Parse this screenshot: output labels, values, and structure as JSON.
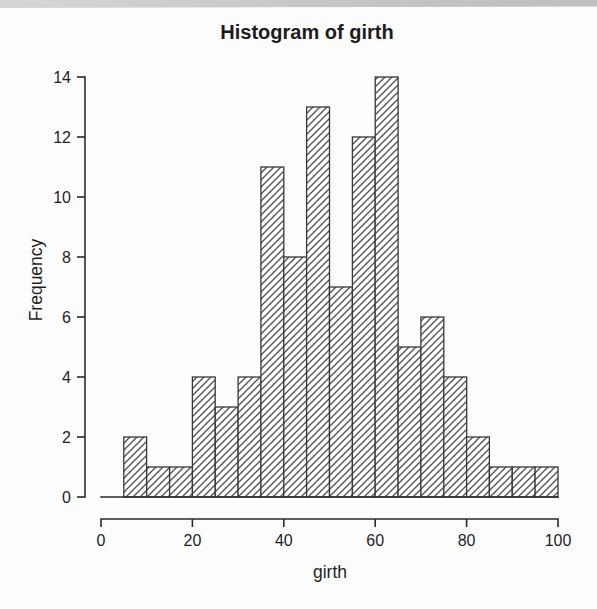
{
  "figure": {
    "kind": "scanned-r-plot"
  },
  "colors": {
    "paper": "#fdfdfd",
    "scan_band": "#c9c9c9",
    "axis": "#2a2a2a",
    "text": "#1f1f1f",
    "bar_fill": "#ffffff",
    "bar_border": "#383838",
    "bar_hatch": "#4f4f4f"
  },
  "chart_data": {
    "type": "bar",
    "subtype": "histogram",
    "title": "Histogram of girth",
    "xlabel": "girth",
    "ylabel": "Frequency",
    "xlim": [
      0,
      100
    ],
    "ylim": [
      0,
      14
    ],
    "x_ticks": [
      0,
      20,
      40,
      60,
      80,
      100
    ],
    "y_ticks": [
      0,
      2,
      4,
      6,
      8,
      10,
      12,
      14
    ],
    "bin_width": 5,
    "bin_edges": [
      5,
      10,
      15,
      20,
      25,
      30,
      35,
      40,
      45,
      50,
      55,
      60,
      65,
      70,
      75,
      80,
      85,
      90,
      95,
      100
    ],
    "counts": [
      2,
      1,
      1,
      4,
      3,
      4,
      11,
      8,
      13,
      7,
      12,
      14,
      5,
      6,
      4,
      2,
      1,
      1,
      1
    ],
    "total_n": 100,
    "grid": false,
    "legend": null,
    "hatch": "diagonal-forward"
  }
}
